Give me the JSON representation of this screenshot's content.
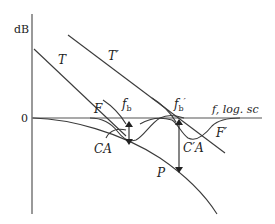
{
  "axes": {
    "y_label": "dB",
    "zero_label": "0",
    "x_label": "f, log. sc"
  },
  "curves": {
    "T": "T",
    "T_prime": "T′",
    "F": "F",
    "F_prime": "F′",
    "P": "P"
  },
  "markers": {
    "fb": "f",
    "fb_sub": "b",
    "fb_prime": "f",
    "fb_prime_sub": "b",
    "fb_prime_mark": "′"
  },
  "annotations": {
    "CA": "CA",
    "C_prime_A": "C′A"
  },
  "colors": {
    "line": "#3a3a3a",
    "text": "#222222",
    "background": "#ffffff"
  }
}
